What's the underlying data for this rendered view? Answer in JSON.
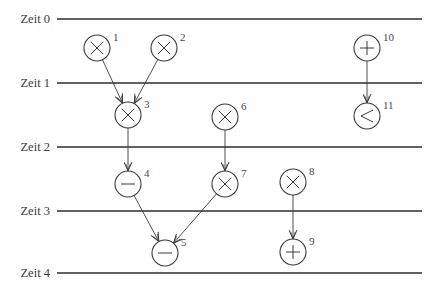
{
  "diagram": {
    "type": "scheduled-dataflow-graph",
    "time_steps": [
      {
        "label": "Zeit 0",
        "y": 19
      },
      {
        "label": "Zeit 1",
        "y": 83
      },
      {
        "label": "Zeit 2",
        "y": 147
      },
      {
        "label": "Zeit 3",
        "y": 211
      },
      {
        "label": "Zeit 4",
        "y": 273
      }
    ],
    "line_x_start": 57,
    "line_x_end": 422,
    "node_radius": 13,
    "nodes": [
      {
        "id": "1",
        "op": "multiply",
        "symbol": "×",
        "cx": 97,
        "cy": 48,
        "step": 1
      },
      {
        "id": "2",
        "op": "multiply",
        "symbol": "×",
        "cx": 164,
        "cy": 48,
        "step": 1
      },
      {
        "id": "3",
        "op": "multiply",
        "symbol": "×",
        "cx": 128,
        "cy": 115,
        "step": 2
      },
      {
        "id": "4",
        "op": "subtract",
        "symbol": "−",
        "cx": 128,
        "cy": 184,
        "step": 3
      },
      {
        "id": "5",
        "op": "subtract",
        "symbol": "−",
        "cx": 165,
        "cy": 253,
        "step": 4
      },
      {
        "id": "6",
        "op": "multiply",
        "symbol": "×",
        "cx": 225,
        "cy": 117,
        "step": 2
      },
      {
        "id": "7",
        "op": "multiply",
        "symbol": "×",
        "cx": 225,
        "cy": 184,
        "step": 3
      },
      {
        "id": "8",
        "op": "multiply",
        "symbol": "×",
        "cx": 293,
        "cy": 182,
        "step": 3
      },
      {
        "id": "9",
        "op": "add",
        "symbol": "+",
        "cx": 293,
        "cy": 252,
        "step": 4
      },
      {
        "id": "10",
        "op": "add",
        "symbol": "+",
        "cx": 367,
        "cy": 48,
        "step": 1
      },
      {
        "id": "11",
        "op": "less-than",
        "symbol": "<",
        "cx": 367,
        "cy": 116,
        "step": 2
      }
    ],
    "edges": [
      {
        "from": "1",
        "to": "3"
      },
      {
        "from": "2",
        "to": "3"
      },
      {
        "from": "3",
        "to": "4"
      },
      {
        "from": "6",
        "to": "7"
      },
      {
        "from": "4",
        "to": "5"
      },
      {
        "from": "7",
        "to": "5"
      },
      {
        "from": "8",
        "to": "9"
      },
      {
        "from": "10",
        "to": "11"
      }
    ]
  }
}
